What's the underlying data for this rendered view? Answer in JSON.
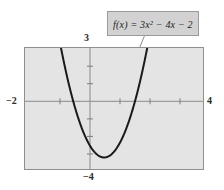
{
  "figure": {
    "kind": "function-graph",
    "callout": {
      "text": "f(x) = 3x² − 4x − 2"
    },
    "axis_labels": {
      "x_min": "−2",
      "x_max": "4",
      "y_max": "3",
      "y_min": "−4"
    },
    "colors": {
      "page_background": "#ffffff",
      "plot_background": "#e4e4e4",
      "frame_border": "#8f8f8f",
      "axis_line": "#8a8a8a",
      "curve": "#1a1a1a",
      "callout_fill": "#d2d2d2",
      "callout_border": "#9a9a9a",
      "text": "#2b2b2b"
    }
  },
  "chart_data": {
    "type": "line",
    "title": "",
    "subtitle": "",
    "xlabel": "",
    "ylabel": "",
    "equation": "f(x) = 3x^2 - 4x - 2",
    "coefficients": {
      "a": 3,
      "b": -4,
      "c": -2
    },
    "vertex": {
      "x": 0.667,
      "y": -3.333
    },
    "roots": {
      "x1": -0.387,
      "x2": 1.721
    },
    "y_intercept": -2,
    "xlim": [
      -2,
      4
    ],
    "ylim": [
      -4,
      3
    ],
    "xticks": [
      -2,
      -1,
      0,
      1,
      2,
      3,
      4
    ],
    "yticks": [
      -4,
      -3,
      -2,
      -1,
      0,
      1,
      2,
      3
    ],
    "tick_labels_shown": [
      "−2",
      "4",
      "3",
      "−4"
    ],
    "grid": false,
    "legend": "none",
    "annotations": [
      {
        "text": "f(x) = 3x² − 4x − 2",
        "type": "callout-box-with-leader-line",
        "points_to": {
          "x": 1.92,
          "y": 3.0
        }
      }
    ],
    "series": [
      {
        "name": "f(x) = 3x^2 - 4x - 2",
        "x": [
          -1.0,
          -0.9,
          -0.8,
          -0.7,
          -0.6,
          -0.5,
          -0.4,
          -0.3,
          -0.2,
          -0.1,
          0.0,
          0.1,
          0.2,
          0.3,
          0.4,
          0.5,
          0.6,
          0.7,
          0.8,
          0.9,
          1.0,
          1.1,
          1.2,
          1.3,
          1.4,
          1.5,
          1.6,
          1.7,
          1.8,
          1.9,
          2.0
        ],
        "y": [
          5.0,
          4.03,
          3.12,
          2.27,
          1.48,
          0.75,
          0.08,
          -0.53,
          -1.08,
          -1.57,
          -2.0,
          -2.37,
          -2.68,
          -2.93,
          -3.12,
          -3.25,
          -3.32,
          -3.33,
          -3.28,
          -3.17,
          -3.0,
          -2.77,
          -2.48,
          -2.13,
          -1.72,
          -1.25,
          -0.72,
          -0.13,
          0.52,
          1.23,
          2.0
        ]
      }
    ]
  }
}
